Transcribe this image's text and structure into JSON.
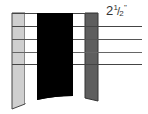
{
  "diagram": {
    "measurement_label": {
      "whole": "2",
      "numerator": "1",
      "slash": "/",
      "denominator": "2",
      "unit": "\""
    },
    "colors": {
      "light_strip": "#cfcfcf",
      "black_band": "#000000",
      "dark_strip": "#5e5e5e",
      "lines": "#444444"
    },
    "horizontal_lines_count": 4
  }
}
